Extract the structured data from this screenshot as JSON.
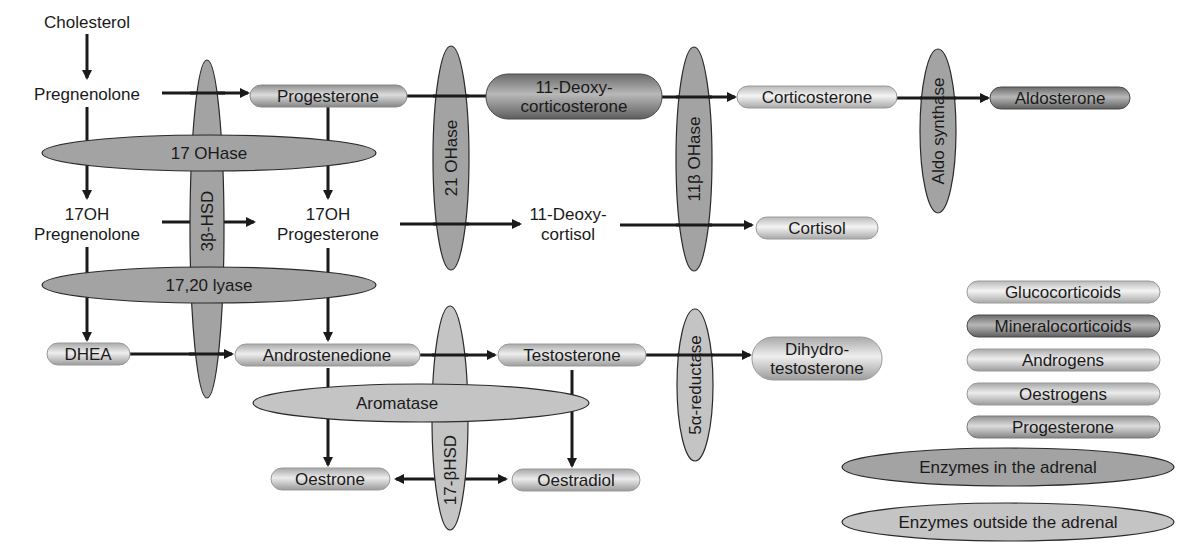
{
  "colors": {
    "background": "#ffffff",
    "line": "#1a1a1a",
    "enzyme_adrenal": "#a3a3a3",
    "enzyme_outside": "#c4c4c4",
    "glucocorticoid": "#d8d8d8",
    "mineralocorticoid": "#7a7a7a",
    "androgen": "#cfcfcf",
    "oestrogen": "#cccccc",
    "progesterone": "#b5b5b5"
  },
  "compounds": {
    "cholesterol": {
      "label": "Cholesterol",
      "class": "none"
    },
    "pregnenolone": {
      "label": "Pregnenolone",
      "class": "none"
    },
    "progesterone": {
      "label": "Progesterone",
      "class": "progesterone"
    },
    "deoxycorticosterone": {
      "line1": "11-Deoxy-",
      "line2": "corticosterone",
      "class": "mineralocorticoid"
    },
    "corticosterone": {
      "label": "Corticosterone",
      "class": "glucocorticoid"
    },
    "aldosterone": {
      "label": "Aldosterone",
      "class": "mineralocorticoid"
    },
    "oh_pregnenolone": {
      "line1": "17OH",
      "line2": "Pregnenolone",
      "class": "none"
    },
    "oh_progesterone": {
      "line1": "17OH",
      "line2": "Progesterone",
      "class": "none"
    },
    "deoxycortisol": {
      "line1": "11-Deoxy-",
      "line2": "cortisol",
      "class": "none"
    },
    "cortisol": {
      "label": "Cortisol",
      "class": "glucocorticoid"
    },
    "dhea": {
      "label": "DHEA",
      "class": "androgen"
    },
    "androstenedione": {
      "label": "Androstenedione",
      "class": "androgen"
    },
    "testosterone": {
      "label": "Testosterone",
      "class": "androgen"
    },
    "dihydrotestosterone": {
      "line1": "Dihydro-",
      "line2": "testosterone",
      "class": "androgen"
    },
    "oestrone": {
      "label": "Oestrone",
      "class": "oestrogen"
    },
    "oestradiol": {
      "label": "Oestradiol",
      "class": "oestrogen"
    }
  },
  "enzymes": {
    "hsd3b": {
      "label": "3β-HSD",
      "location": "adrenal",
      "orientation": "vertical"
    },
    "oh17": {
      "label": "17 OHase",
      "location": "adrenal",
      "orientation": "horizontal"
    },
    "lyase": {
      "label": "17,20 lyase",
      "location": "adrenal",
      "orientation": "horizontal"
    },
    "oh21": {
      "label": "21 OHase",
      "location": "adrenal",
      "orientation": "vertical"
    },
    "oh11b": {
      "label": "11β OHase",
      "location": "adrenal",
      "orientation": "vertical"
    },
    "aldo": {
      "label": "Aldo synthase",
      "location": "adrenal",
      "orientation": "vertical"
    },
    "aromatase": {
      "label": "Aromatase",
      "location": "outside",
      "orientation": "horizontal"
    },
    "hsd17b": {
      "label": "17-βHSD",
      "location": "outside",
      "orientation": "vertical"
    },
    "reductase": {
      "label": "5α-reductase",
      "location": "outside",
      "orientation": "vertical"
    }
  },
  "legend": {
    "items": [
      {
        "label": "Glucocorticoids",
        "class": "glucocorticoid"
      },
      {
        "label": "Mineralocorticoids",
        "class": "mineralocorticoid"
      },
      {
        "label": "Androgens",
        "class": "androgen"
      },
      {
        "label": "Oestrogens",
        "class": "oestrogen"
      },
      {
        "label": "Progesterone",
        "class": "progesterone"
      }
    ],
    "enzyme_adrenal": "Enzymes in the adrenal",
    "enzyme_outside": "Enzymes outside the adrenal"
  }
}
